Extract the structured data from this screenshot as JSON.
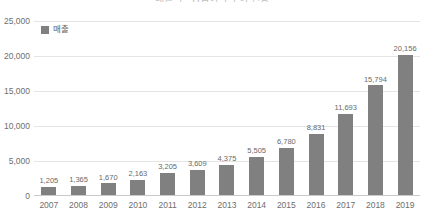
{
  "chart_data": {
    "type": "bar",
    "title": "매출액 · 영업이익 추이 현황",
    "xlabel": "",
    "ylabel": "",
    "categories": [
      "2007",
      "2008",
      "2009",
      "2010",
      "2011",
      "2012",
      "2013",
      "2014",
      "2015",
      "2016",
      "2017",
      "2018",
      "2019"
    ],
    "values": [
      1205,
      1365,
      1670,
      2163,
      3205,
      3609,
      4375,
      5505,
      6780,
      8831,
      11693,
      15794,
      20156
    ],
    "data_labels": [
      "1,205",
      "1,365",
      "1,670",
      "2,163",
      "3,205",
      "3,609",
      "4,375",
      "5,505",
      "6,780",
      "8,831",
      "11,693",
      "15,794",
      "20,156"
    ],
    "series": [
      {
        "name": "매출",
        "color": "#808080",
        "values": [
          1205,
          1365,
          1670,
          2163,
          3205,
          3609,
          4375,
          5505,
          6780,
          8831,
          11693,
          15794,
          20156
        ]
      }
    ],
    "ylim": [
      0,
      25000
    ],
    "ytick_values": [
      0,
      5000,
      10000,
      15000,
      20000,
      25000
    ],
    "ytick_labels": [
      "0",
      "5,000",
      "10,000",
      "15,000",
      "20,000",
      "25,000"
    ],
    "grid": true,
    "legend": {
      "position": "top-left",
      "entries": [
        {
          "label": "매출",
          "color": "#808080"
        }
      ]
    },
    "colors": {
      "bar": "#808080",
      "gridline": "#e4e4e4",
      "axis_line": "#c9c9c9",
      "tick_text": "#6e6e6e",
      "label_text": "#6a6a6a",
      "background": "#ffffff"
    }
  }
}
